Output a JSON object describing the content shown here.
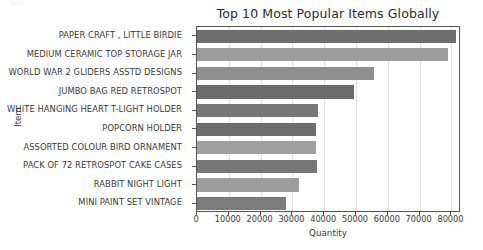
{
  "chart_data": {
    "type": "bar",
    "orientation": "horizontal",
    "title": "Top 10 Most Popular Items Globally",
    "xlabel": "Quantity",
    "ylabel": "Item",
    "categories": [
      "PAPER CRAFT , LITTLE BIRDIE",
      "MEDIUM CERAMIC TOP STORAGE JAR",
      "WORLD WAR 2 GLIDERS ASSTD DESIGNS",
      "JUMBO BAG RED RETROSPOT",
      "WHITE HANGING HEART T-LIGHT HOLDER",
      "POPCORN HOLDER",
      "ASSORTED COLOUR BIRD ORNAMENT",
      "PACK OF 72 RETROSPOT CAKE CASES",
      "RABBIT NIGHT LIGHT",
      "MINI PAINT SET VINTAGE"
    ],
    "values": [
      81500,
      79000,
      55500,
      49500,
      38000,
      37500,
      37500,
      37600,
      32000,
      28000
    ],
    "xticks": [
      0,
      10000,
      20000,
      30000,
      40000,
      50000,
      60000,
      70000,
      80000
    ],
    "xticklabels": [
      "0",
      "10000",
      "20000",
      "30000",
      "40000",
      "50000",
      "60000",
      "70000",
      "80000"
    ],
    "xlim": [
      0,
      83000
    ],
    "grid": true,
    "legend": null,
    "bar_colors": [
      "#6e6e6e",
      "#9c9c9c",
      "#8f8f8f",
      "#6b6b6b",
      "#777777",
      "#6c6c6c",
      "#a0a0a0",
      "#767676",
      "#9d9d9d",
      "#7b7b7b"
    ],
    "colors": {
      "axis": "#555555",
      "grid": "#e2e2e2",
      "text": "#3a3a3a",
      "title": "#2b2b2b",
      "background": "#ffffff"
    }
  }
}
